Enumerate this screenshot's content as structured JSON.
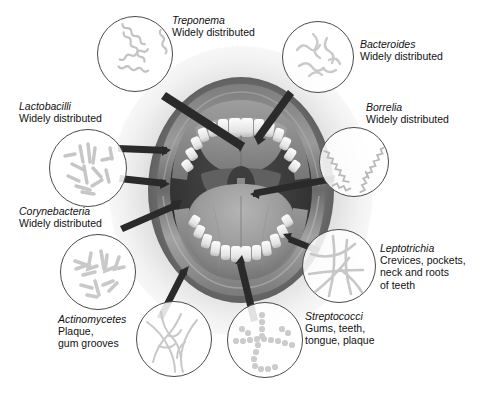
{
  "figure": {
    "background_color": "#ffffff",
    "line_color": "#4a4a4a",
    "text_color": "#111111",
    "bacteria_draw_color": "#c9c9c9"
  },
  "central_image": {
    "name": "open-mouth-illustration",
    "description": "Grayscale illustration of an open human mouth showing lips, upper and lower teeth, gums, tongue, palate and throat"
  },
  "organisms": [
    {
      "id": "treponema",
      "genus": "Treponema",
      "habitat": "Widely distributed",
      "morphology": "spirochete",
      "label_align": "left"
    },
    {
      "id": "bacteroides",
      "genus": "Bacteroides",
      "habitat": "Widely distributed",
      "morphology": "wavy-rod",
      "label_align": "left"
    },
    {
      "id": "borrelia",
      "genus": "Borrelia",
      "habitat": "Widely distributed",
      "morphology": "zigzag-spirochete",
      "label_align": "right"
    },
    {
      "id": "lactobacilli",
      "genus": "Lactobacilli",
      "habitat": "Widely distributed",
      "morphology": "short-rod",
      "label_align": "left"
    },
    {
      "id": "corynebacteria",
      "genus": "Corynebacteria",
      "habitat": "Widely distributed",
      "morphology": "club-rod",
      "label_align": "left"
    },
    {
      "id": "actinomycetes",
      "genus": "Actinomycetes",
      "habitat": "Plaque,\ngum grooves",
      "habitat_line1": "Plaque,",
      "habitat_line2": "gum grooves",
      "morphology": "branching-filament",
      "label_align": "left"
    },
    {
      "id": "streptococci",
      "genus": "Streptococci",
      "habitat_line1": "Gums, teeth,",
      "habitat_line2": "tongue, plaque",
      "morphology": "coccus-chain",
      "label_align": "left"
    },
    {
      "id": "leptotrichia",
      "genus": "Leptotrichia",
      "habitat_line1": "Crevices, pockets,",
      "habitat_line2": "neck and roots",
      "habitat_line3": "of teeth",
      "morphology": "straight-filament",
      "label_align": "left"
    }
  ]
}
